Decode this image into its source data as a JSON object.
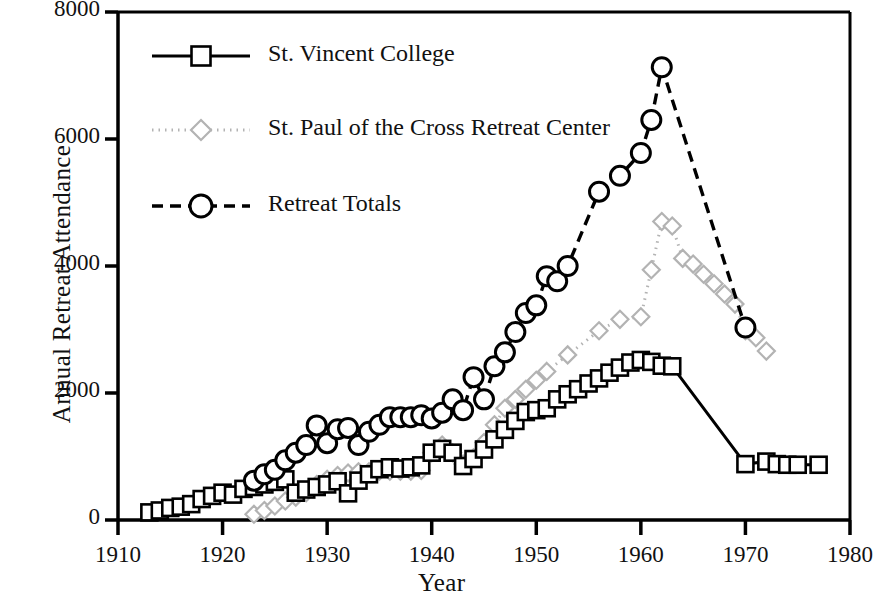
{
  "chart_data": {
    "type": "line",
    "title": "",
    "xlabel": "Year",
    "ylabel": "Annual Retreat Attendance",
    "xlim": [
      1910,
      1980
    ],
    "ylim": [
      0,
      8000
    ],
    "xticks": [
      1910,
      1920,
      1930,
      1940,
      1950,
      1960,
      1970,
      1980
    ],
    "yticks": [
      0,
      2000,
      4000,
      6000,
      8000
    ],
    "grid": false,
    "legend_position": "upper-left-inside",
    "series": [
      {
        "name": "St. Vincent College",
        "marker": "square",
        "linestyle": "solid",
        "color": "#000000",
        "points": [
          [
            1913,
            120
          ],
          [
            1914,
            150
          ],
          [
            1915,
            190
          ],
          [
            1916,
            210
          ],
          [
            1917,
            250
          ],
          [
            1918,
            330
          ],
          [
            1919,
            380
          ],
          [
            1920,
            430
          ],
          [
            1921,
            400
          ],
          [
            1922,
            490
          ],
          [
            1923,
            520
          ],
          [
            1924,
            560
          ],
          [
            1925,
            600
          ],
          [
            1926,
            640
          ],
          [
            1927,
            430
          ],
          [
            1928,
            480
          ],
          [
            1929,
            520
          ],
          [
            1930,
            560
          ],
          [
            1931,
            610
          ],
          [
            1932,
            420
          ],
          [
            1933,
            620
          ],
          [
            1934,
            720
          ],
          [
            1935,
            800
          ],
          [
            1936,
            830
          ],
          [
            1937,
            810
          ],
          [
            1938,
            830
          ],
          [
            1939,
            860
          ],
          [
            1940,
            1060
          ],
          [
            1941,
            1120
          ],
          [
            1942,
            1060
          ],
          [
            1943,
            850
          ],
          [
            1944,
            960
          ],
          [
            1945,
            1110
          ],
          [
            1946,
            1270
          ],
          [
            1947,
            1420
          ],
          [
            1948,
            1560
          ],
          [
            1949,
            1700
          ],
          [
            1950,
            1730
          ],
          [
            1951,
            1760
          ],
          [
            1952,
            1900
          ],
          [
            1953,
            1980
          ],
          [
            1954,
            2060
          ],
          [
            1955,
            2150
          ],
          [
            1956,
            2230
          ],
          [
            1957,
            2320
          ],
          [
            1958,
            2400
          ],
          [
            1959,
            2480
          ],
          [
            1960,
            2520
          ],
          [
            1961,
            2490
          ],
          [
            1962,
            2430
          ],
          [
            1963,
            2420
          ],
          [
            1970,
            880
          ],
          [
            1972,
            920
          ],
          [
            1973,
            880
          ],
          [
            1974,
            870
          ],
          [
            1975,
            870
          ],
          [
            1977,
            870
          ]
        ]
      },
      {
        "name": "St. Paul of the Cross Retreat Center",
        "marker": "diamond",
        "linestyle": "dotted",
        "color": "#b3b3b3",
        "points": [
          [
            1923,
            90
          ],
          [
            1924,
            150
          ],
          [
            1925,
            220
          ],
          [
            1926,
            300
          ],
          [
            1927,
            360
          ],
          [
            1928,
            430
          ],
          [
            1929,
            560
          ],
          [
            1930,
            640
          ],
          [
            1931,
            700
          ],
          [
            1932,
            740
          ],
          [
            1933,
            760
          ],
          [
            1934,
            760
          ],
          [
            1935,
            770
          ],
          [
            1936,
            770
          ],
          [
            1937,
            770
          ],
          [
            1938,
            770
          ],
          [
            1939,
            780
          ],
          [
            1940,
            1060
          ],
          [
            1941,
            1180
          ],
          [
            1942,
            1060
          ],
          [
            1943,
            880
          ],
          [
            1944,
            980
          ],
          [
            1945,
            1220
          ],
          [
            1946,
            1500
          ],
          [
            1947,
            1760
          ],
          [
            1948,
            1900
          ],
          [
            1949,
            2060
          ],
          [
            1950,
            2200
          ],
          [
            1951,
            2340
          ],
          [
            1953,
            2600
          ],
          [
            1956,
            2980
          ],
          [
            1958,
            3160
          ],
          [
            1960,
            3200
          ],
          [
            1961,
            3940
          ],
          [
            1962,
            4700
          ],
          [
            1963,
            4630
          ],
          [
            1964,
            4120
          ],
          [
            1965,
            4030
          ],
          [
            1966,
            3870
          ],
          [
            1967,
            3720
          ],
          [
            1968,
            3560
          ],
          [
            1969,
            3400
          ],
          [
            1970,
            2980
          ],
          [
            1971,
            2870
          ],
          [
            1972,
            2660
          ]
        ]
      },
      {
        "name": "Retreat Totals",
        "marker": "circle",
        "linestyle": "dashed",
        "color": "#000000",
        "points": [
          [
            1923,
            620
          ],
          [
            1924,
            720
          ],
          [
            1925,
            790
          ],
          [
            1926,
            940
          ],
          [
            1927,
            1060
          ],
          [
            1928,
            1180
          ],
          [
            1929,
            1490
          ],
          [
            1930,
            1210
          ],
          [
            1931,
            1430
          ],
          [
            1932,
            1450
          ],
          [
            1933,
            1180
          ],
          [
            1934,
            1390
          ],
          [
            1935,
            1500
          ],
          [
            1936,
            1620
          ],
          [
            1937,
            1620
          ],
          [
            1938,
            1620
          ],
          [
            1939,
            1650
          ],
          [
            1940,
            1600
          ],
          [
            1941,
            1690
          ],
          [
            1942,
            1900
          ],
          [
            1943,
            1730
          ],
          [
            1944,
            2250
          ],
          [
            1945,
            1900
          ],
          [
            1946,
            2420
          ],
          [
            1947,
            2640
          ],
          [
            1948,
            2960
          ],
          [
            1949,
            3260
          ],
          [
            1950,
            3380
          ],
          [
            1951,
            3840
          ],
          [
            1952,
            3760
          ],
          [
            1953,
            4000
          ],
          [
            1956,
            5170
          ],
          [
            1958,
            5420
          ],
          [
            1960,
            5780
          ],
          [
            1961,
            6300
          ],
          [
            1962,
            7130
          ],
          [
            1970,
            3030
          ]
        ]
      }
    ]
  },
  "legend": {
    "items": [
      {
        "label": "St. Vincent College",
        "key": "st-vincent-college"
      },
      {
        "label": "St. Paul of the Cross Retreat Center",
        "key": "st-paul-of-the-cross"
      },
      {
        "label": "Retreat Totals",
        "key": "retreat-totals"
      }
    ]
  },
  "axes": {
    "y_title": "Annual Retreat Attendance",
    "x_title": "Year",
    "y_ticks": [
      "8000",
      "6000",
      "4000",
      "2000",
      "0"
    ],
    "x_ticks": [
      "1910",
      "1920",
      "1930",
      "1940",
      "1950",
      "1960",
      "1970",
      "1980"
    ]
  }
}
